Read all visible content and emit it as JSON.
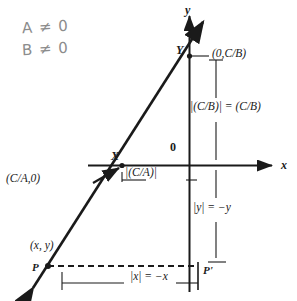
{
  "figure": {
    "axes": {
      "y_axis_label": "y",
      "x_axis_label": "x",
      "origin_label": "0"
    },
    "points": {
      "y_intercept_label": "Y",
      "x_intercept_label": "X",
      "p_label": "P",
      "p_prime_label": "P'"
    },
    "labels": {
      "y_intercept_coord": "(0,C/B)",
      "y_intercept_measure": "|(C/B)| = (C/B)",
      "x_intercept_coord": "(C/A,0)",
      "x_intercept_measure": "|(C/A)|",
      "y_measure": "|y| = −y",
      "x_measure": "|x| = −x",
      "point_p_coord": "(x, y)"
    },
    "annotations": [
      {
        "name": "condition-a",
        "text": "A ≠ 0"
      },
      {
        "name": "condition-b",
        "text": "B ≠ 0"
      }
    ],
    "colors": {
      "ink": "#1a1a1a",
      "pencil": "#8c8c8c",
      "background": "#ffffff"
    }
  }
}
